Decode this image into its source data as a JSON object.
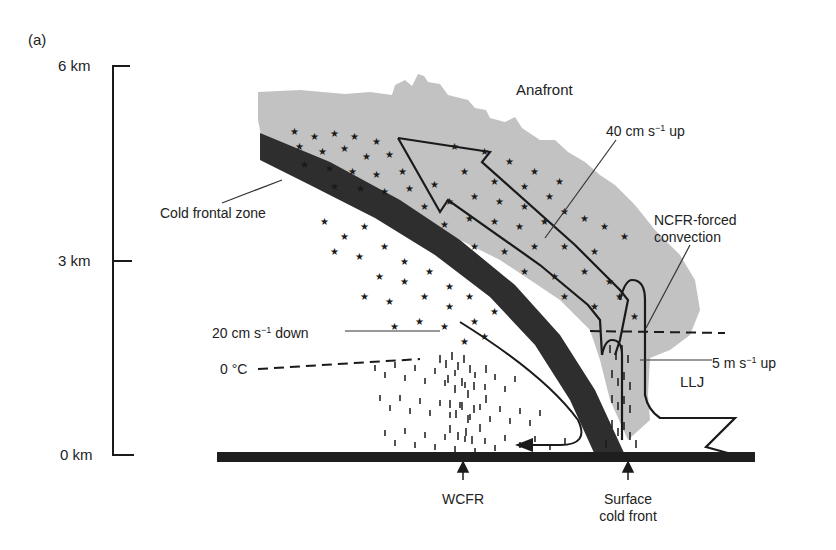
{
  "figure": {
    "panel_label": "(a)",
    "title": "Anafront"
  },
  "axis": {
    "ticks": [
      {
        "label": "6 km",
        "value": 6
      },
      {
        "label": "3 km",
        "value": 3
      },
      {
        "label": "0 km",
        "value": 0
      }
    ]
  },
  "labels": {
    "cold_frontal_zone": "Cold frontal zone",
    "up40_prefix": "40 cm s",
    "up40_exp": "−1",
    "up40_suffix": " up",
    "ncfr_line1": "NCFR-forced",
    "ncfr_line2": "convection",
    "down20_prefix": "20 cm s",
    "down20_exp": "−1",
    "down20_suffix": " down",
    "zero_c": "0 °C",
    "up5_prefix": "5 m s",
    "up5_exp": "−1",
    "up5_suffix": " up",
    "llj": "LLJ",
    "wcfr": "WCFR",
    "surface_line1": "Surface",
    "surface_line2": "cold front"
  },
  "colors": {
    "cloud": "#c2c2c2",
    "frontal_zone": "#2e2e2e",
    "ground": "#1e1e1e",
    "ink": "#1a1a1a"
  }
}
